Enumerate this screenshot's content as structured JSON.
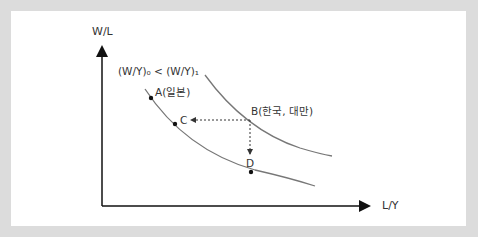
{
  "diagram": {
    "y_axis_label": "W/L",
    "x_axis_label": "L/Y",
    "curve_relation_label": "(W/Y)₀ < (W/Y)₁",
    "points": {
      "A": "A(일본)",
      "B": "B(한국, 대만)",
      "C": "C",
      "D": "D"
    },
    "colors": {
      "frame": "#dcdcdc",
      "curve": "#777777",
      "axis": "#111111"
    }
  }
}
